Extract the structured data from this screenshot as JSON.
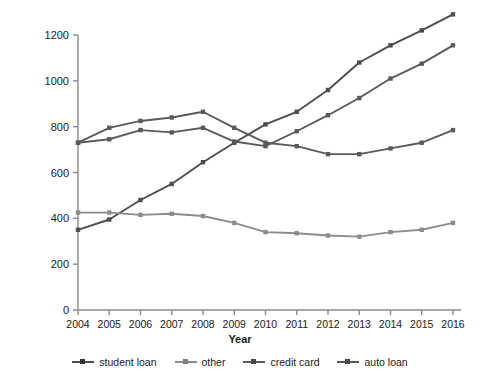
{
  "chart_data": {
    "type": "line",
    "title": "",
    "xlabel": "Year",
    "ylabel": "Amount of Debt, in Billions",
    "categories": [
      "2004",
      "2005",
      "2006",
      "2007",
      "2008",
      "2009",
      "2010",
      "2011",
      "2012",
      "2013",
      "2014",
      "2015",
      "2016"
    ],
    "x": [
      2004,
      2005,
      2006,
      2007,
      2008,
      2009,
      2010,
      2011,
      2012,
      2013,
      2014,
      2015,
      2016
    ],
    "xlim": [
      2004,
      2016
    ],
    "ylim": [
      0,
      1200
    ],
    "yticks": [
      0,
      200,
      400,
      600,
      800,
      1000,
      1200
    ],
    "ytick_labels": [
      "0",
      "200",
      "400",
      "600",
      "800",
      "1000",
      "1200"
    ],
    "grid": false,
    "legend_position": "bottom",
    "series": [
      {
        "name": "student loan",
        "color": "#4d4d4d",
        "values": [
          350,
          395,
          480,
          550,
          645,
          730,
          810,
          865,
          960,
          1080,
          1155,
          1220,
          1290
        ]
      },
      {
        "name": "other",
        "color": "#8c8c8c",
        "values": [
          425,
          425,
          415,
          420,
          410,
          380,
          340,
          335,
          325,
          320,
          340,
          350,
          380
        ]
      },
      {
        "name": "credit card",
        "color": "#5a5a5a",
        "values": [
          730,
          795,
          825,
          840,
          865,
          795,
          730,
          715,
          680,
          680,
          705,
          730,
          785
        ]
      },
      {
        "name": "auto loan",
        "color": "#5a5a5a",
        "values": [
          730,
          745,
          785,
          775,
          795,
          735,
          715,
          780,
          850,
          925,
          1010,
          1075,
          1155
        ]
      }
    ]
  },
  "legend": {
    "items": [
      {
        "label": "student loan"
      },
      {
        "label": "other"
      },
      {
        "label": "credit card"
      },
      {
        "label": "auto loan"
      }
    ]
  },
  "axes": {
    "x_title": "Year",
    "y_title": "Amount of Debt, in Billions"
  }
}
